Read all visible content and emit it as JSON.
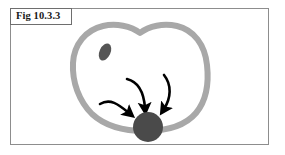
{
  "figure": {
    "caption": "Fig 10.3.3",
    "background_color": "#ffffff",
    "frame_color": "#8d8d8d",
    "caption_box_border_color": "#6e6e6e",
    "caption_text_color": "#1a1a1a"
  },
  "diagram": {
    "type": "biological-cell-schematic",
    "membrane": {
      "label": "cell-membrane",
      "stroke_color": "#a8a8a8",
      "stroke_width": 6,
      "fill_color": "none",
      "shape": "bilobed-with-top-notch",
      "bounds": {
        "x": 72,
        "y": 25,
        "width": 136,
        "height": 105
      }
    },
    "organelle": {
      "label": "organelle-ellipse",
      "fill_color": "#555555",
      "center_x": 105,
      "center_y": 52,
      "radius_x": 5.5,
      "radius_y": 9,
      "rotation_deg": 25
    },
    "body": {
      "label": "dark-circular-body",
      "fill_color": "#4a4a4a",
      "center_x": 148,
      "center_y": 127,
      "radius": 15
    },
    "arrows": [
      {
        "label": "arrow-left",
        "color": "#000000",
        "stroke_width": 2.6,
        "path": "M 100,104 C 110,98 118,104 130,114",
        "head_angle_deg": 40
      },
      {
        "label": "arrow-middle",
        "color": "#000000",
        "stroke_width": 2.6,
        "path": "M 127,79 C 139,82 144,94 145,109",
        "head_angle_deg": 84
      },
      {
        "label": "arrow-right",
        "color": "#000000",
        "stroke_width": 2.6,
        "path": "M 164,75 C 172,85 171,98 163,110",
        "head_angle_deg": 124
      }
    ]
  }
}
